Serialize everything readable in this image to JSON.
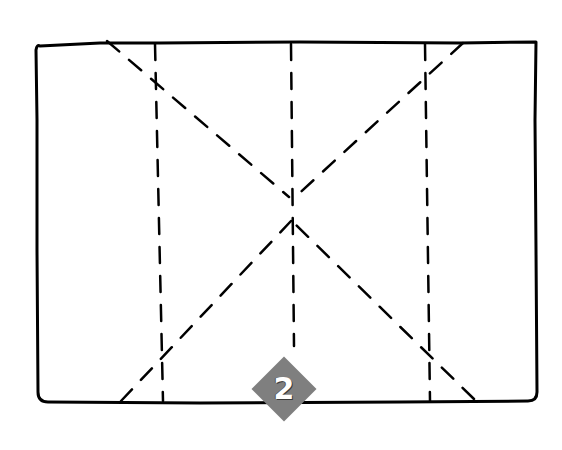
{
  "diagram": {
    "step_number": "2",
    "colors": {
      "background": "#ffffff",
      "outline": "#000000",
      "fold_lines": "#000000",
      "badge_fill": "#7f7f7f",
      "badge_text": "#ffffff"
    },
    "sheet": {
      "left": 35,
      "top": 42,
      "right": 538,
      "bottom": 403
    },
    "vertical_folds_x": [
      158,
      292,
      428
    ],
    "diagonal_folds": [
      {
        "from": [
          107,
          40
        ],
        "to": [
          290,
          198
        ]
      },
      {
        "from": [
          463,
          42
        ],
        "to": [
          292,
          198
        ]
      },
      {
        "from": [
          120,
          402
        ],
        "to": [
          292,
          222
        ]
      },
      {
        "from": [
          474,
          400
        ],
        "to": [
          292,
          222
        ]
      }
    ]
  }
}
